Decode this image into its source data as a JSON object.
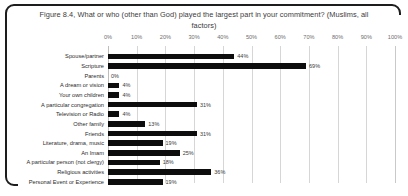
{
  "chart_data": {
    "type": "bar",
    "orientation": "horizontal",
    "title": "Figure 8.4, What or who (other than God) played the largest part in your commitment? (Muslims, all factors)",
    "xlabel": "",
    "ylabel": "",
    "xlim": [
      0,
      100
    ],
    "xtick_labels": [
      "0%",
      "10%",
      "20%",
      "30%",
      "40%",
      "50%",
      "60%",
      "70%",
      "80%",
      "90%",
      "100%"
    ],
    "xtick_values": [
      0,
      10,
      20,
      30,
      40,
      50,
      60,
      70,
      80,
      90,
      100
    ],
    "grid": true,
    "legend": "none",
    "bar_color": "#0d0d0d",
    "categories": [
      "Spouse/partner",
      "Scripture",
      "Parents",
      "A dream or vision",
      "Your own children",
      "A particular congregation",
      "Television or Radio",
      "Other family",
      "Friends",
      "Literature, drama, music",
      "An Imam",
      "A particular person (not clergy)",
      "Religious activities",
      "Personal Event or Experience"
    ],
    "values": [
      44,
      69,
      0,
      4,
      4,
      31,
      4,
      13,
      31,
      19,
      25,
      18,
      36,
      19
    ],
    "value_labels": [
      "44%",
      "69%",
      "0%",
      "4%",
      "4%",
      "31%",
      "4%",
      "13%",
      "31%",
      "19%",
      "25%",
      "18%",
      "36%",
      "19%"
    ]
  }
}
